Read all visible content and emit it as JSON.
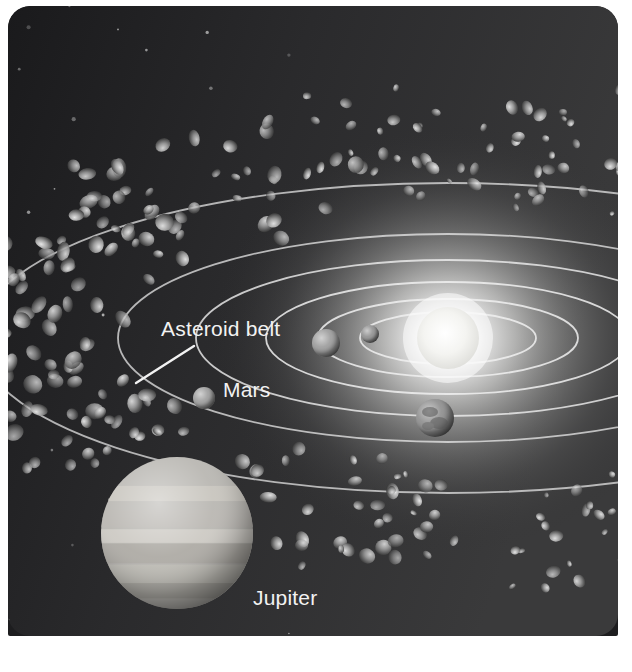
{
  "figure": {
    "name": "solar-system-asteroid-belt-illustration",
    "media_type": "grayscale-astronomy-illustration",
    "background_color": "#1d1d1f",
    "glow_color": "#fafafa",
    "orbit_line_color": "#f0f0f0",
    "label_text_color": "#f2f2f2",
    "page_background": "#ffffff"
  },
  "labels": [
    {
      "id": "asteroid-belt",
      "text": "Asteroid belt",
      "x": 153,
      "y": 330,
      "anchor": "start",
      "leader_line": {
        "x1": 186,
        "y1": 340,
        "x2": 128,
        "y2": 377
      }
    },
    {
      "id": "mars",
      "text": "Mars",
      "x": 215,
      "y": 391,
      "anchor": "start",
      "leader_line": null
    },
    {
      "id": "jupiter",
      "text": "Jupiter",
      "x": 245,
      "y": 599,
      "anchor": "start",
      "leader_line": null
    }
  ],
  "sun": {
    "name": "sun",
    "cx": 440,
    "cy": 332,
    "r": 31,
    "glow_r": 200,
    "color": "#f6f6f4"
  },
  "planets": [
    {
      "name": "mercury",
      "cx": 362,
      "cy": 328,
      "r": 9,
      "tone": "#8f8f8f",
      "banded": false
    },
    {
      "name": "venus",
      "cx": 318,
      "cy": 337,
      "r": 14,
      "tone": "#9a9a9a",
      "banded": false
    },
    {
      "name": "earth",
      "cx": 427,
      "cy": 412,
      "r": 19,
      "tone": "#8c8c8c",
      "banded": false
    },
    {
      "name": "mars",
      "cx": 196,
      "cy": 392,
      "r": 11,
      "tone": "#9c9c9c",
      "banded": false
    },
    {
      "name": "jupiter",
      "cx": 169,
      "cy": 527,
      "r": 76,
      "tone": "#b9b7b2",
      "banded": true
    }
  ],
  "orbits": [
    {
      "name": "mercury-orbit",
      "cx": 440,
      "cy": 332,
      "rx": 88,
      "ry": 26,
      "opacity": 0.85
    },
    {
      "name": "venus-orbit",
      "cx": 440,
      "cy": 332,
      "rx": 130,
      "ry": 39,
      "opacity": 0.85
    },
    {
      "name": "earth-orbit",
      "cx": 440,
      "cy": 332,
      "rx": 182,
      "ry": 56,
      "opacity": 0.85
    },
    {
      "name": "mars-orbit",
      "cx": 440,
      "cy": 332,
      "rx": 252,
      "ry": 78,
      "opacity": 0.8
    },
    {
      "name": "belt-inner-orbit",
      "cx": 440,
      "cy": 332,
      "rx": 330,
      "ry": 104,
      "opacity": 0.72
    },
    {
      "name": "jupiter-orbit",
      "cx": 440,
      "cy": 332,
      "rx": 470,
      "ry": 155,
      "opacity": 0.7
    }
  ],
  "asteroid_belt": {
    "name": "asteroid-belt-ring",
    "cx": 440,
    "cy": 332,
    "inner_rx": 300,
    "inner_ry": 96,
    "outer_rx": 520,
    "outer_ry": 182,
    "count": 230,
    "rock_color": "#a7a7a7",
    "rock_shadow": "#3c3c3c"
  },
  "stars": {
    "name": "background-starfield",
    "count": 70,
    "color": "#d8d8d8"
  }
}
